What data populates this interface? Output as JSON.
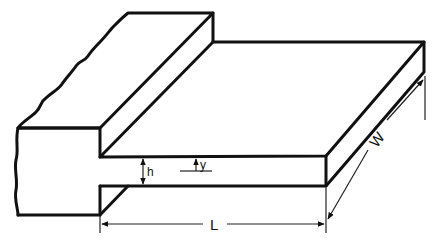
{
  "diagram": {
    "labels": {
      "thickness": "h",
      "coordinate": "y",
      "length": "L",
      "width": "W"
    },
    "colors": {
      "line": "#111111",
      "background": "#ffffff"
    }
  }
}
